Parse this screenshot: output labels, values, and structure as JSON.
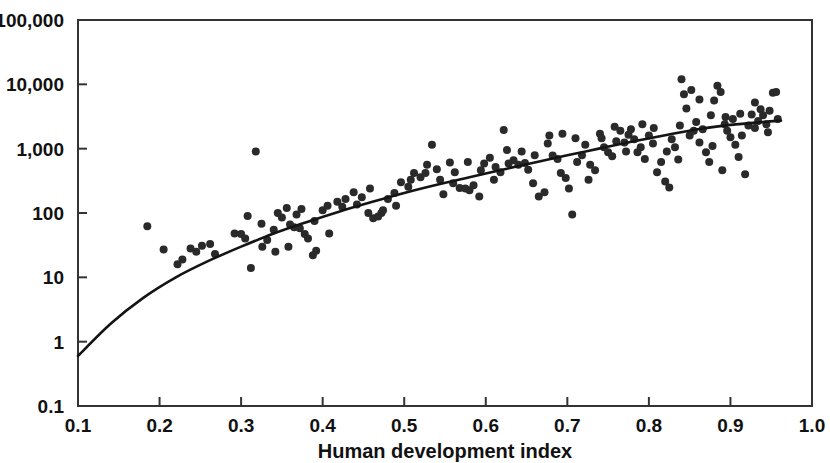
{
  "chart_data": {
    "type": "scatter",
    "title": "",
    "subtitle": "",
    "xlabel": "Human development index",
    "ylabel": "",
    "xlim": [
      0.1,
      1.0
    ],
    "ylim": [
      0.1,
      100000
    ],
    "yscale": "log",
    "xscale": "linear",
    "grid": false,
    "legend": null,
    "xticks": [
      0.1,
      0.2,
      0.3,
      0.4,
      0.5,
      0.6,
      0.7,
      0.8,
      0.9,
      1.0
    ],
    "xticklabels": [
      "0.1",
      "0.2",
      "0.3",
      "0.4",
      "0.5",
      "0.6",
      "0.7",
      "0.8",
      "0.9",
      "1.0"
    ],
    "yticks": [
      0.1,
      1,
      10,
      100,
      1000,
      10000,
      100000
    ],
    "yticklabels": [
      "0.1",
      "1",
      "10",
      "100",
      "1,000",
      "10,000",
      "100,000"
    ],
    "annotations": [],
    "series": [
      {
        "name": "countries",
        "type": "scatter",
        "marker": "circle",
        "color": "#2a2a2a",
        "marker_size": 8,
        "points": [
          [
            0.185,
            62
          ],
          [
            0.205,
            27
          ],
          [
            0.222,
            16
          ],
          [
            0.228,
            19
          ],
          [
            0.238,
            28
          ],
          [
            0.245,
            25
          ],
          [
            0.252,
            31
          ],
          [
            0.262,
            33
          ],
          [
            0.268,
            23
          ],
          [
            0.292,
            48
          ],
          [
            0.3,
            47
          ],
          [
            0.305,
            40
          ],
          [
            0.312,
            14
          ],
          [
            0.318,
            900
          ],
          [
            0.325,
            68
          ],
          [
            0.332,
            38
          ],
          [
            0.34,
            55
          ],
          [
            0.345,
            100
          ],
          [
            0.35,
            85
          ],
          [
            0.356,
            120
          ],
          [
            0.36,
            66
          ],
          [
            0.365,
            60
          ],
          [
            0.368,
            95
          ],
          [
            0.372,
            58
          ],
          [
            0.378,
            47
          ],
          [
            0.382,
            40
          ],
          [
            0.388,
            22
          ],
          [
            0.392,
            26
          ],
          [
            0.4,
            110
          ],
          [
            0.408,
            48
          ],
          [
            0.418,
            150
          ],
          [
            0.428,
            165
          ],
          [
            0.438,
            210
          ],
          [
            0.448,
            175
          ],
          [
            0.456,
            100
          ],
          [
            0.462,
            83
          ],
          [
            0.468,
            88
          ],
          [
            0.472,
            100
          ],
          [
            0.48,
            165
          ],
          [
            0.488,
            205
          ],
          [
            0.496,
            300
          ],
          [
            0.505,
            255
          ],
          [
            0.512,
            420
          ],
          [
            0.52,
            360
          ],
          [
            0.528,
            560
          ],
          [
            0.534,
            1150
          ],
          [
            0.54,
            480
          ],
          [
            0.548,
            195
          ],
          [
            0.556,
            610
          ],
          [
            0.562,
            430
          ],
          [
            0.568,
            245
          ],
          [
            0.575,
            240
          ],
          [
            0.58,
            225
          ],
          [
            0.585,
            270
          ],
          [
            0.592,
            180
          ],
          [
            0.598,
            590
          ],
          [
            0.605,
            720
          ],
          [
            0.612,
            520
          ],
          [
            0.618,
            430
          ],
          [
            0.622,
            1950
          ],
          [
            0.628,
            590
          ],
          [
            0.634,
            660
          ],
          [
            0.64,
            560
          ],
          [
            0.648,
            600
          ],
          [
            0.652,
            470
          ],
          [
            0.658,
            290
          ],
          [
            0.665,
            180
          ],
          [
            0.672,
            210
          ],
          [
            0.678,
            1600
          ],
          [
            0.682,
            780
          ],
          [
            0.688,
            690
          ],
          [
            0.692,
            420
          ],
          [
            0.698,
            350
          ],
          [
            0.702,
            240
          ],
          [
            0.706,
            95
          ],
          [
            0.712,
            620
          ],
          [
            0.718,
            790
          ],
          [
            0.722,
            1150
          ],
          [
            0.728,
            560
          ],
          [
            0.734,
            460
          ],
          [
            0.74,
            1700
          ],
          [
            0.745,
            1050
          ],
          [
            0.75,
            880
          ],
          [
            0.755,
            760
          ],
          [
            0.76,
            1300
          ],
          [
            0.765,
            1900
          ],
          [
            0.77,
            1250
          ],
          [
            0.775,
            1650
          ],
          [
            0.778,
            2000
          ],
          [
            0.782,
            1400
          ],
          [
            0.786,
            880
          ],
          [
            0.79,
            1050
          ],
          [
            0.795,
            690
          ],
          [
            0.8,
            1600
          ],
          [
            0.805,
            1200
          ],
          [
            0.81,
            430
          ],
          [
            0.815,
            620
          ],
          [
            0.82,
            310
          ],
          [
            0.825,
            250
          ],
          [
            0.828,
            1400
          ],
          [
            0.832,
            1050
          ],
          [
            0.836,
            680
          ],
          [
            0.84,
            12000
          ],
          [
            0.843,
            7000
          ],
          [
            0.846,
            4200
          ],
          [
            0.85,
            1600
          ],
          [
            0.855,
            1900
          ],
          [
            0.858,
            2600
          ],
          [
            0.862,
            1250
          ],
          [
            0.866,
            2000
          ],
          [
            0.87,
            880
          ],
          [
            0.874,
            620
          ],
          [
            0.878,
            1100
          ],
          [
            0.88,
            5600
          ],
          [
            0.884,
            9500
          ],
          [
            0.888,
            7600
          ],
          [
            0.89,
            460
          ],
          [
            0.893,
            2400
          ],
          [
            0.896,
            1900
          ],
          [
            0.9,
            1500
          ],
          [
            0.903,
            2900
          ],
          [
            0.906,
            1150
          ],
          [
            0.91,
            740
          ],
          [
            0.914,
            1600
          ],
          [
            0.918,
            400
          ],
          [
            0.922,
            2300
          ],
          [
            0.926,
            3400
          ],
          [
            0.93,
            2100
          ],
          [
            0.934,
            2700
          ],
          [
            0.937,
            4100
          ],
          [
            0.94,
            3300
          ],
          [
            0.944,
            2400
          ],
          [
            0.948,
            3900
          ],
          [
            0.952,
            7400
          ],
          [
            0.956,
            7600
          ],
          [
            0.958,
            2900
          ],
          [
            0.946,
            1800
          ],
          [
            0.93,
            5200
          ],
          [
            0.912,
            3500
          ],
          [
            0.894,
            3100
          ],
          [
            0.876,
            3300
          ],
          [
            0.862,
            5800
          ],
          [
            0.852,
            8200
          ],
          [
            0.838,
            2300
          ],
          [
            0.822,
            900
          ],
          [
            0.806,
            2100
          ],
          [
            0.792,
            2400
          ],
          [
            0.772,
            900
          ],
          [
            0.758,
            2200
          ],
          [
            0.742,
            1450
          ],
          [
            0.726,
            330
          ],
          [
            0.71,
            1450
          ],
          [
            0.694,
            1700
          ],
          [
            0.676,
            1200
          ],
          [
            0.66,
            790
          ],
          [
            0.644,
            900
          ],
          [
            0.626,
            950
          ],
          [
            0.61,
            330
          ],
          [
            0.594,
            460
          ],
          [
            0.578,
            620
          ],
          [
            0.56,
            290
          ],
          [
            0.544,
            330
          ],
          [
            0.526,
            420
          ],
          [
            0.508,
            330
          ],
          [
            0.49,
            130
          ],
          [
            0.474,
            110
          ],
          [
            0.458,
            240
          ],
          [
            0.442,
            135
          ],
          [
            0.424,
            125
          ],
          [
            0.406,
            130
          ],
          [
            0.39,
            75
          ],
          [
            0.374,
            115
          ],
          [
            0.358,
            30
          ],
          [
            0.342,
            25
          ],
          [
            0.326,
            30
          ],
          [
            0.308,
            90
          ]
        ]
      }
    ],
    "fit_curve": {
      "name": "fitted trend",
      "type": "line",
      "color": "#141414",
      "description": "monotonic increasing log-scale trend line",
      "points": [
        [
          0.1,
          0.6
        ],
        [
          0.14,
          1.9
        ],
        [
          0.18,
          4.8
        ],
        [
          0.22,
          10.0
        ],
        [
          0.26,
          18.0
        ],
        [
          0.3,
          30.0
        ],
        [
          0.34,
          48.0
        ],
        [
          0.38,
          72.0
        ],
        [
          0.42,
          105.0
        ],
        [
          0.46,
          148.0
        ],
        [
          0.5,
          205.0
        ],
        [
          0.54,
          275.0
        ],
        [
          0.58,
          360.0
        ],
        [
          0.62,
          470.0
        ],
        [
          0.66,
          610.0
        ],
        [
          0.7,
          790.0
        ],
        [
          0.74,
          1010.0
        ],
        [
          0.78,
          1290.0
        ],
        [
          0.82,
          1620.0
        ],
        [
          0.86,
          2000.0
        ],
        [
          0.9,
          2340.0
        ],
        [
          0.94,
          2600.0
        ],
        [
          0.962,
          2720.0
        ]
      ]
    }
  },
  "axes": {
    "x_title": "Human development index",
    "y_title": ""
  }
}
